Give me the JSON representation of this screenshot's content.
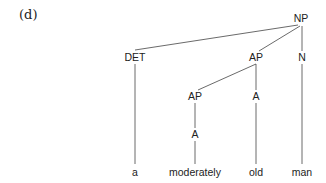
{
  "figure_label": "(d)",
  "tree": {
    "nodes": [
      {
        "id": "np",
        "label": "NP",
        "x": 301,
        "y": 22
      },
      {
        "id": "det",
        "label": "DET",
        "x": 135,
        "y": 61
      },
      {
        "id": "ap1",
        "label": "AP",
        "x": 256,
        "y": 61
      },
      {
        "id": "n",
        "label": "N",
        "x": 302,
        "y": 61
      },
      {
        "id": "ap2",
        "label": "AP",
        "x": 195,
        "y": 100
      },
      {
        "id": "a1",
        "label": "A",
        "x": 256,
        "y": 100
      },
      {
        "id": "a2",
        "label": "A",
        "x": 195,
        "y": 138
      },
      {
        "id": "w_a",
        "label": "a",
        "x": 135,
        "y": 176
      },
      {
        "id": "w_moderately",
        "label": "moderately",
        "x": 195,
        "y": 176
      },
      {
        "id": "w_old",
        "label": "old",
        "x": 256,
        "y": 176
      },
      {
        "id": "w_man",
        "label": "man",
        "x": 302,
        "y": 176
      }
    ],
    "edges": [
      {
        "from": "np",
        "to": "det",
        "x1": 298,
        "y1": 25,
        "x2": 135,
        "y2": 50
      },
      {
        "from": "np",
        "to": "ap1",
        "x1": 300,
        "y1": 26,
        "x2": 259,
        "y2": 51
      },
      {
        "from": "np",
        "to": "n",
        "x1": 302,
        "y1": 26,
        "x2": 302,
        "y2": 51
      },
      {
        "from": "det",
        "to": "w_a",
        "x1": 135,
        "y1": 64,
        "x2": 135,
        "y2": 164
      },
      {
        "from": "ap1",
        "to": "ap2",
        "x1": 256,
        "y1": 64,
        "x2": 198,
        "y2": 90
      },
      {
        "from": "ap1",
        "to": "a1",
        "x1": 256,
        "y1": 64,
        "x2": 256,
        "y2": 90
      },
      {
        "from": "n",
        "to": "w_man",
        "x1": 302,
        "y1": 64,
        "x2": 302,
        "y2": 164
      },
      {
        "from": "ap2",
        "to": "a2",
        "x1": 195,
        "y1": 103,
        "x2": 195,
        "y2": 128
      },
      {
        "from": "a1",
        "to": "w_old",
        "x1": 256,
        "y1": 103,
        "x2": 256,
        "y2": 164
      },
      {
        "from": "a2",
        "to": "w_moderately",
        "x1": 195,
        "y1": 141,
        "x2": 195,
        "y2": 164
      }
    ]
  }
}
